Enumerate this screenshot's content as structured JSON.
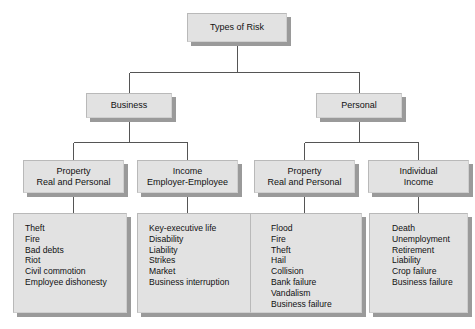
{
  "diagram": {
    "title": "Types of Risk",
    "type": "hierarchy-tree",
    "root": {
      "label": "Types of Risk"
    },
    "level2": [
      {
        "label": "Business"
      },
      {
        "label": "Personal"
      }
    ],
    "level3": [
      {
        "line1": "Property",
        "line2": "Real and Personal"
      },
      {
        "line1": "Income",
        "line2": "Employer-Employee"
      },
      {
        "line1": "Property",
        "line2": "Real and Personal"
      },
      {
        "line1": "Individual",
        "line2": "Income"
      }
    ],
    "leaves": [
      {
        "parent": "Property Real and Personal (Business)",
        "items": [
          "Theft",
          "Fire",
          "Bad debts",
          "Riot",
          "Civil commotion",
          "Employee dishonesty"
        ]
      },
      {
        "parent": "Income Employer-Employee",
        "items": [
          "Key-executive life",
          "Disability",
          "Liability",
          "Strikes",
          "Market",
          "Business interruption"
        ]
      },
      {
        "parent": "Property Real and Personal (Personal)",
        "items": [
          "Flood",
          "Fire",
          "Theft",
          "Hail",
          "Collision",
          "Bank failure",
          "Vandalism",
          "Business failure"
        ]
      },
      {
        "parent": "Individual Income",
        "items": [
          "Death",
          "Unemployment",
          "Retirement",
          "Liability",
          "Crop failure",
          "Business failure"
        ]
      }
    ],
    "colors": {
      "background": "#ffffff",
      "box_fill": "#e2e2e2",
      "box_shadow": "#9a9a9a",
      "connector": "#555555",
      "text": "#111111"
    }
  }
}
